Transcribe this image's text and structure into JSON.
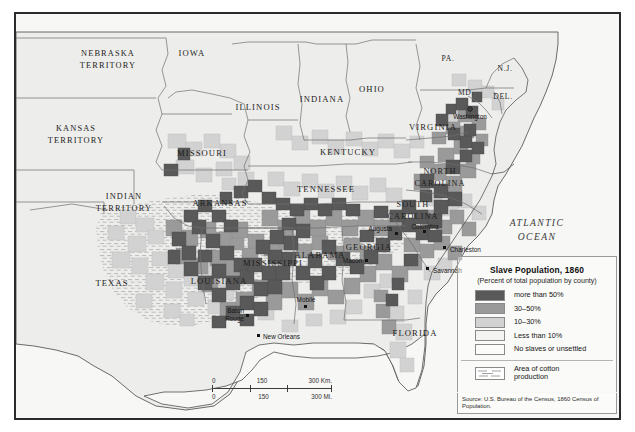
{
  "map": {
    "ocean_label": "ATLANTIC\nOCEAN",
    "ocean_line1": "ATLANTIC",
    "ocean_line2": "OCEAN",
    "states": [
      {
        "name": "NEBRASKA\nTERRITORY",
        "line1": "NEBRASKA",
        "line2": "TERRITORY",
        "x": 92,
        "y": 42
      },
      {
        "name": "KANSAS\nTERRITORY",
        "line1": "KANSAS",
        "line2": "TERRITORY",
        "x": 60,
        "y": 117
      },
      {
        "name": "INDIAN\nTERRITORY",
        "line1": "INDIAN",
        "line2": "TERRITORY",
        "x": 108,
        "y": 185
      },
      {
        "name": "IOWA",
        "line1": "IOWA",
        "line2": "",
        "x": 176,
        "y": 42
      },
      {
        "name": "MISSOURI",
        "line1": "MISSOURI",
        "line2": "",
        "x": 186,
        "y": 142
      },
      {
        "name": "ARKANSAS",
        "line1": "ARKANSAS",
        "line2": "",
        "x": 204,
        "y": 192
      },
      {
        "name": "TEXAS",
        "line1": "TEXAS",
        "line2": "",
        "x": 96,
        "y": 272
      },
      {
        "name": "LOUISIANA",
        "line1": "LOUISIANA",
        "line2": "",
        "x": 203,
        "y": 270
      },
      {
        "name": "ILLINOIS",
        "line1": "ILLINOIS",
        "line2": "",
        "x": 242,
        "y": 96
      },
      {
        "name": "INDIANA",
        "line1": "INDIANA",
        "line2": "",
        "x": 306,
        "y": 88
      },
      {
        "name": "OHIO",
        "line1": "OHIO",
        "line2": "",
        "x": 356,
        "y": 78
      },
      {
        "name": "KENTUCKY",
        "line1": "KENTUCKY",
        "line2": "",
        "x": 332,
        "y": 141
      },
      {
        "name": "TENNESSEE",
        "line1": "TENNESSEE",
        "line2": "",
        "x": 310,
        "y": 178
      },
      {
        "name": "MISSISSIPPI",
        "line1": "MISSISSIPPI",
        "line2": "",
        "x": 257,
        "y": 252
      },
      {
        "name": "ALABAMA",
        "line1": "ALABAMA",
        "line2": "",
        "x": 304,
        "y": 244
      },
      {
        "name": "GEORGIA",
        "line1": "GEORGIA",
        "line2": "",
        "x": 353,
        "y": 236
      },
      {
        "name": "FLORIDA",
        "line1": "FLORIDA",
        "line2": "",
        "x": 399,
        "y": 322
      },
      {
        "name": "VIRGINIA",
        "line1": "VIRGINIA",
        "line2": "",
        "x": 417,
        "y": 116
      },
      {
        "name": "NORTH\nCAROLINA",
        "line1": "NORTH",
        "line2": "CAROLINA",
        "x": 424,
        "y": 160
      },
      {
        "name": "SOUTH\nCAROLINA",
        "line1": "SOUTH",
        "line2": "CAROLINA",
        "x": 397,
        "y": 193
      }
    ],
    "abbrs": [
      {
        "label": "PA.",
        "x": 432,
        "y": 47
      },
      {
        "label": "N.J.",
        "x": 489,
        "y": 57
      },
      {
        "label": "MD.",
        "x": 450,
        "y": 81
      },
      {
        "label": "DEL.",
        "x": 487,
        "y": 85
      }
    ],
    "cities": [
      {
        "name": "Washington",
        "x": 454,
        "y": 95,
        "align": "middle",
        "dx": 0,
        "dy": 8
      },
      {
        "name": "Columbia",
        "x": 409,
        "y": 219,
        "align": "middle",
        "dx": 0,
        "dy": -4
      },
      {
        "name": "Charleston",
        "x": 429,
        "y": 235,
        "align": "start",
        "dx": 5,
        "dy": 3
      },
      {
        "name": "Savannah",
        "x": 412,
        "y": 256,
        "align": "start",
        "dx": 5,
        "dy": 3
      },
      {
        "name": "Augusta",
        "x": 377,
        "y": 221,
        "align": "end",
        "dx": -5,
        "dy": 2
      },
      {
        "name": "Macon",
        "x": 348,
        "y": 248,
        "align": "end",
        "dx": -4,
        "dy": 3
      },
      {
        "name": "Mobile",
        "x": 290,
        "y": 290,
        "align": "middle",
        "dx": 0,
        "dy": -4
      },
      {
        "name": "New Orleans",
        "x": 243,
        "y": 323,
        "align": "start",
        "dx": 5,
        "dy": 3
      },
      {
        "name": "Baton Rouge",
        "x": 232,
        "y": 305,
        "line1": "Baton",
        "line2": "Rouge",
        "align": "end",
        "dx": -4,
        "dy": -1
      }
    ]
  },
  "legend": {
    "title": "Slave Population, 1860",
    "subtitle": "(Percent of total population by county)",
    "classes": [
      {
        "label": "more than 50%",
        "color": "#595959"
      },
      {
        "label": "30–50%",
        "color": "#9a9a9a"
      },
      {
        "label": "10–30%",
        "color": "#d2d2d2"
      },
      {
        "label": "Less than 10%",
        "color": "#f1f1ef"
      },
      {
        "label": "No slaves or unsettled",
        "color": "#fafaf8"
      }
    ],
    "cotton_label": "Area of cotton\nproduction",
    "cotton_line1": "Area of cotton",
    "cotton_line2": "production"
  },
  "scale": {
    "km": [
      "0",
      "150",
      "300 Km."
    ],
    "mi": [
      "0",
      "150",
      "300 Mi."
    ]
  },
  "source": "Source: U.S. Bureau of the Census, 1860 Census of Population.",
  "colors": {
    "class_50plus": "#595959",
    "class_30_50": "#9a9a9a",
    "class_10_30": "#d2d2d2",
    "class_under10": "#f1f1ef",
    "class_none": "#fafaf8",
    "ocean": "#f7f7f5",
    "land_base": "#ededeb",
    "frame": "#2b2b2b"
  }
}
